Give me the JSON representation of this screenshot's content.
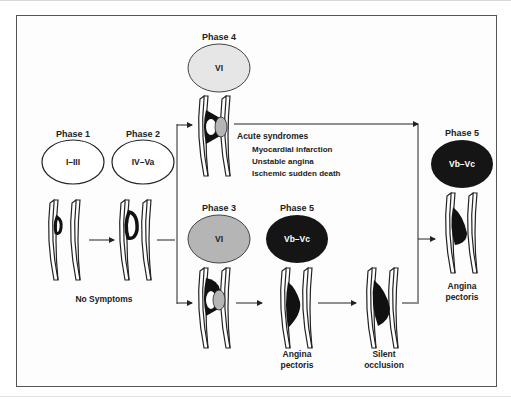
{
  "diagram": {
    "phases": {
      "phase1": {
        "label": "Phase 1",
        "lesion": "I–III"
      },
      "phase2": {
        "label": "Phase 2",
        "lesion": "IV–Va"
      },
      "phase3": {
        "label": "Phase 3",
        "lesion": "VI"
      },
      "phase4": {
        "label": "Phase 4",
        "lesion": "VI"
      },
      "phase5_mid": {
        "label": "Phase 5",
        "lesion": "Vb–Vc"
      },
      "phase5_right": {
        "label": "Phase 5",
        "lesion": "Vb–Vc"
      }
    },
    "outcomes": {
      "no_symptoms": "No Symptoms",
      "acute_title": "Acute syndromes",
      "acute_items": [
        "Myocardial infarction",
        "Unstable angina",
        "Ischemic sudden death"
      ],
      "angina_mid_1": "Angina",
      "angina_mid_2": "pectoris",
      "silent_1": "Silent",
      "silent_2": "occlusion",
      "angina_right_1": "Angina",
      "angina_right_2": "pectoris"
    },
    "colors": {
      "outline": "#222222",
      "gray_fill": "#b5b5b5",
      "light_gray_fill": "#e6e6e6",
      "black_fill": "#151515",
      "frame": "#555555"
    }
  }
}
